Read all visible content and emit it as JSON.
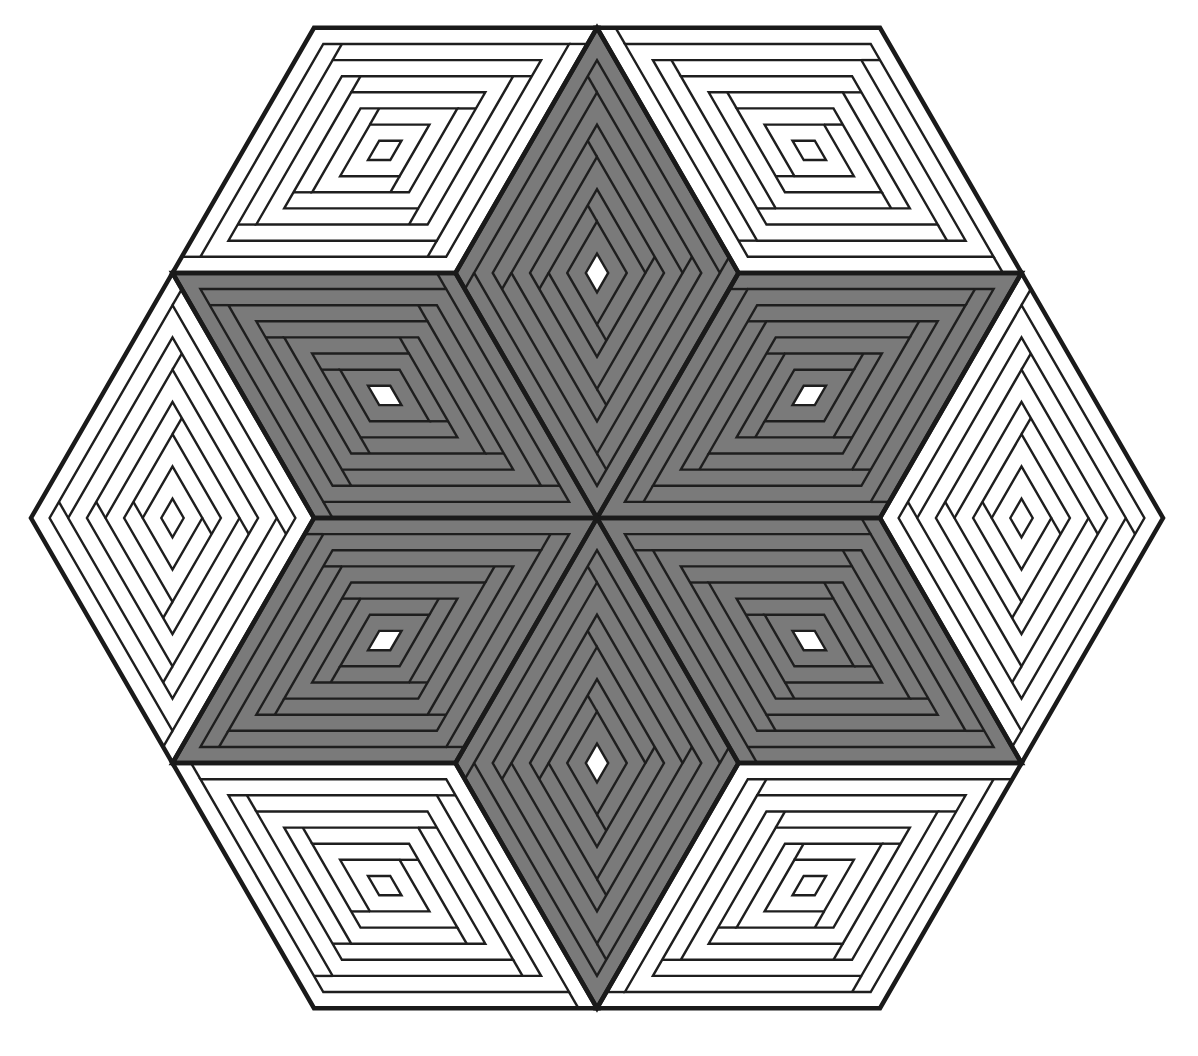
{
  "figure": {
    "center": [
      597,
      518
    ],
    "rhombus_side": 283,
    "rounds": 6,
    "colors": {
      "background": "#ffffff",
      "light_fabric": "#ffffff",
      "dark_fabric": "#7a7a7a",
      "seam_line": "#1e1e1e",
      "center_square": "#ffffff"
    },
    "star_points": [
      {
        "name": "star-point-top",
        "tone": "gray",
        "dirs": [
          60,
          120
        ]
      },
      {
        "name": "star-point-upper-right",
        "tone": "gray",
        "dirs": [
          0,
          60
        ]
      },
      {
        "name": "star-point-lower-right",
        "tone": "gray",
        "dirs": [
          300,
          0
        ]
      },
      {
        "name": "star-point-bottom",
        "tone": "gray",
        "dirs": [
          240,
          300
        ]
      },
      {
        "name": "star-point-lower-left",
        "tone": "gray",
        "dirs": [
          180,
          240
        ]
      },
      {
        "name": "star-point-upper-left",
        "tone": "gray",
        "dirs": [
          120,
          180
        ]
      }
    ],
    "border_diamonds": [
      {
        "name": "border-diamond-top-left",
        "tone": "white"
      },
      {
        "name": "border-diamond-top-right",
        "tone": "white"
      },
      {
        "name": "border-diamond-right",
        "tone": "white"
      },
      {
        "name": "border-diamond-bottom-right",
        "tone": "white"
      },
      {
        "name": "border-diamond-bottom-left",
        "tone": "white"
      },
      {
        "name": "border-diamond-left",
        "tone": "white"
      }
    ]
  }
}
